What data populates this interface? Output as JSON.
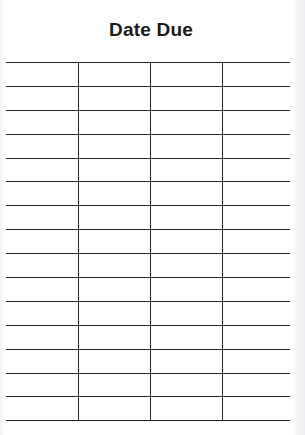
{
  "card": {
    "title": "Date Due",
    "columns": 4,
    "rows": 15,
    "line_color": "#262626",
    "paper_color": "#ffffff",
    "cells": [
      [
        "",
        "",
        "",
        ""
      ],
      [
        "",
        "",
        "",
        ""
      ],
      [
        "",
        "",
        "",
        ""
      ],
      [
        "",
        "",
        "",
        ""
      ],
      [
        "",
        "",
        "",
        ""
      ],
      [
        "",
        "",
        "",
        ""
      ],
      [
        "",
        "",
        "",
        ""
      ],
      [
        "",
        "",
        "",
        ""
      ],
      [
        "",
        "",
        "",
        ""
      ],
      [
        "",
        "",
        "",
        ""
      ],
      [
        "",
        "",
        "",
        ""
      ],
      [
        "",
        "",
        "",
        ""
      ],
      [
        "",
        "",
        "",
        ""
      ],
      [
        "",
        "",
        "",
        ""
      ],
      [
        "",
        "",
        "",
        ""
      ]
    ]
  }
}
